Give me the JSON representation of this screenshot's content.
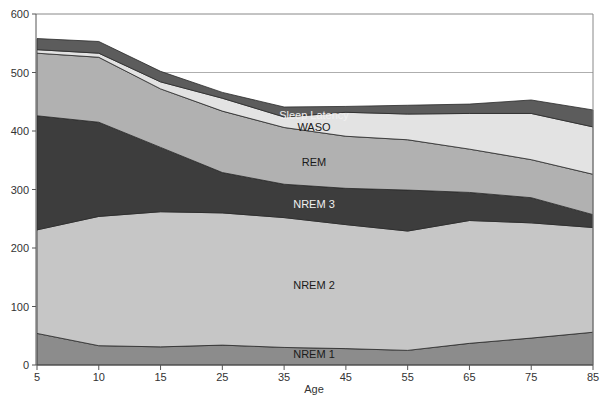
{
  "chart_data": {
    "type": "area",
    "stacked": true,
    "title": "",
    "xlabel": "Age",
    "ylabel": "",
    "ylim": [
      0,
      600
    ],
    "yticks": [
      0,
      100,
      200,
      300,
      400,
      500,
      600
    ],
    "categories": [
      "5",
      "10",
      "15",
      "25",
      "35",
      "45",
      "55",
      "65",
      "75",
      "85"
    ],
    "series": [
      {
        "name": "NREM 1",
        "color": "#8c8c8c",
        "label_color": "#1a1a1a",
        "values": [
          54,
          33,
          31,
          34,
          30,
          28,
          25,
          37,
          46,
          56
        ]
      },
      {
        "name": "NREM 2",
        "color": "#c6c6c6",
        "label_color": "#1a1a1a",
        "values": [
          177,
          221,
          231,
          226,
          222,
          212,
          204,
          210,
          197,
          179
        ]
      },
      {
        "name": "NREM 3",
        "color": "#3d3d3d",
        "label_color": "#f0f0f0",
        "values": [
          195,
          161,
          110,
          69,
          57,
          62,
          70,
          48,
          43,
          22
        ]
      },
      {
        "name": "REM",
        "color": "#b1b1b1",
        "label_color": "#1a1a1a",
        "values": [
          107,
          111,
          100,
          105,
          97,
          89,
          86,
          74,
          65,
          69
        ]
      },
      {
        "name": "WASO",
        "color": "#e3e3e3",
        "label_color": "#1a1a1a",
        "values": [
          6,
          7,
          12,
          22,
          18,
          41,
          44,
          61,
          79,
          81
        ]
      },
      {
        "name": "Sleep Latency",
        "color": "#5c5c5c",
        "label_color": "#f0f0f0",
        "values": [
          19,
          20,
          18,
          10,
          17,
          10,
          15,
          16,
          23,
          29
        ]
      }
    ],
    "annotations": [
      {
        "text": "Sleep Latency",
        "x": 314,
        "y": 119
      },
      {
        "text": "WASO",
        "x": 314,
        "y": 131
      },
      {
        "text": "REM",
        "x": 314,
        "y": 166
      },
      {
        "text": "NREM 3",
        "x": 314,
        "y": 208
      },
      {
        "text": "NREM 2",
        "x": 314,
        "y": 289
      },
      {
        "text": "NREM 1",
        "x": 314,
        "y": 358
      }
    ],
    "gridlines": [
      500
    ],
    "legend": "none (inline labels)"
  }
}
